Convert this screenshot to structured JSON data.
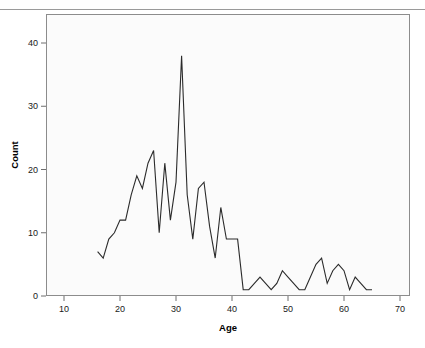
{
  "chart_data": {
    "type": "line",
    "title": "",
    "xlabel": "Age",
    "ylabel": "Count",
    "xlim": [
      6,
      73
    ],
    "ylim": [
      0,
      44.5
    ],
    "grid": false,
    "legend": null,
    "x_ticks": [
      10,
      20,
      30,
      40,
      50,
      60,
      70
    ],
    "y_ticks": [
      0,
      10,
      20,
      30,
      40
    ],
    "x_tick_labels": [
      "10",
      "20",
      "30",
      "40",
      "50",
      "60",
      "70"
    ],
    "y_tick_labels": [
      "0",
      "10",
      "20",
      "30",
      "40"
    ],
    "series": [
      {
        "name": "Count by Age",
        "color": "#2b2b2b",
        "x": [
          16,
          17,
          18,
          19,
          20,
          21,
          22,
          23,
          24,
          25,
          26,
          27,
          28,
          29,
          30,
          31,
          32,
          33,
          34,
          35,
          36,
          37,
          38,
          39,
          40,
          41,
          42,
          43,
          44,
          45,
          46,
          47,
          48,
          49,
          50,
          51,
          52,
          53,
          54,
          55,
          56,
          57,
          58,
          59,
          60,
          61,
          62,
          63,
          64,
          65
        ],
        "y": [
          7,
          6,
          9,
          10,
          12,
          12,
          16,
          19,
          17,
          21,
          23,
          10,
          21,
          12,
          18,
          38,
          16,
          9,
          17,
          18,
          11,
          6,
          14,
          9,
          9,
          9,
          1,
          1,
          2,
          3,
          2,
          1,
          2,
          4,
          3,
          2,
          1,
          1,
          3,
          5,
          6,
          2,
          4,
          5,
          4,
          1,
          3,
          2,
          1,
          1
        ]
      }
    ]
  },
  "axes": {
    "x_title": "Age",
    "y_title": "Count"
  }
}
